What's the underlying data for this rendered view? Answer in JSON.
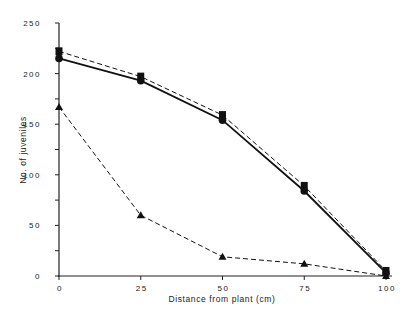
{
  "chart_data": {
    "type": "line",
    "title": "",
    "xlabel": "Distance from plant (cm)",
    "ylabel": "No. of juveniles",
    "xlim": [
      0,
      100
    ],
    "ylim": [
      0,
      250
    ],
    "x": [
      0,
      25,
      50,
      75,
      100
    ],
    "xticks": [
      "0",
      "25",
      "50",
      "75",
      "100"
    ],
    "yticks": [
      "0",
      "50",
      "100",
      "150",
      "200",
      "250"
    ],
    "yminor_step": 25,
    "grid": false,
    "legend": null,
    "series": [
      {
        "name": "squares (dashed)",
        "marker": "square",
        "line": "dashed",
        "values": [
          222,
          197,
          159,
          89,
          5
        ]
      },
      {
        "name": "circles (solid)",
        "marker": "circle",
        "line": "solid",
        "values": [
          215,
          193,
          154,
          84,
          3
        ]
      },
      {
        "name": "triangles (dashed)",
        "marker": "triangle",
        "line": "dashed",
        "values": [
          167,
          60,
          19,
          12,
          0
        ]
      }
    ]
  }
}
